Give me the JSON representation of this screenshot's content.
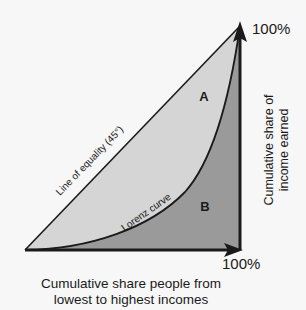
{
  "figure": {
    "type": "lorenz-curve-diagram",
    "background_color": "#f7f7f7",
    "ink_color": "#1a1a1a"
  },
  "axes": {
    "y_tick_label": "100%",
    "x_tick_label": "100%",
    "y_axis_title": "Cumulative share of income earned",
    "x_axis_title_line1": "Cumulative share people from",
    "x_axis_title_line2": "lowest to highest incomes",
    "origin_label": ""
  },
  "series": {
    "equality_line_label": "Line of equality (45°)",
    "lorenz_curve_label": "Lorenz curve"
  },
  "regions": [
    {
      "id": "A",
      "label": "A",
      "description": "Area between line of equality and Lorenz curve",
      "fill_color": "#d5d5d5"
    },
    {
      "id": "B",
      "label": "B",
      "description": "Area under the Lorenz curve",
      "fill_color": "#9a9a9a"
    }
  ],
  "chart_data": {
    "type": "line",
    "title": "",
    "xlabel": "Cumulative share people from lowest to highest incomes",
    "ylabel": "Cumulative share of income earned",
    "xlim": [
      0,
      100
    ],
    "ylim": [
      0,
      100
    ],
    "xticks": [
      100
    ],
    "yticks": [
      100
    ],
    "xtick_labels": [
      "100%"
    ],
    "ytick_labels": [
      "100%"
    ],
    "grid": false,
    "legend": "none",
    "series": [
      {
        "name": "Line of equality (45°)",
        "x": [
          0,
          25,
          50,
          75,
          100
        ],
        "values": [
          0,
          25,
          50,
          75,
          100
        ]
      },
      {
        "name": "Lorenz curve",
        "x": [
          0,
          10,
          20,
          30,
          40,
          50,
          60,
          70,
          80,
          90,
          100
        ],
        "values": [
          0,
          1,
          3,
          6,
          10,
          16,
          23,
          33,
          46,
          66,
          100
        ]
      }
    ],
    "annotations": [
      {
        "text": "A",
        "x": 84,
        "y": 72
      },
      {
        "text": "B",
        "x": 84,
        "y": 20
      },
      {
        "text": "Line of equality (45°)",
        "x": 33,
        "y": 33
      },
      {
        "text": "Lorenz curve",
        "x": 55,
        "y": 18
      }
    ]
  }
}
